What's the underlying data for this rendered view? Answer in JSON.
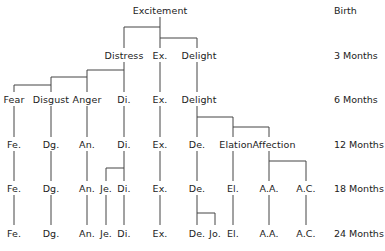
{
  "diagram": {
    "ages": [
      "Birth",
      "3 Months",
      "6 Months",
      "12 Months",
      "18 Months",
      "24 Months"
    ],
    "rows": {
      "birth": [
        "Excitement"
      ],
      "m3": [
        "Distress",
        "Ex.",
        "Delight"
      ],
      "m6": [
        "Fear",
        "Disgust",
        "Anger",
        "Di.",
        "Ex.",
        "Delight"
      ],
      "m12": [
        "Fe.",
        "Dg.",
        "An.",
        "Di.",
        "Ex.",
        "De.",
        "Elation",
        "Affection"
      ],
      "m18": [
        "Fe.",
        "Dg.",
        "An.",
        "Je.",
        "Di.",
        "Ex.",
        "De.",
        "El.",
        "A.A.",
        "A.C."
      ],
      "m24": [
        "Fe.",
        "Dg.",
        "An.",
        "Je.",
        "Di.",
        "Ex.",
        "De.",
        "Jo.",
        "El.",
        "A.A.",
        "A.C."
      ]
    }
  }
}
